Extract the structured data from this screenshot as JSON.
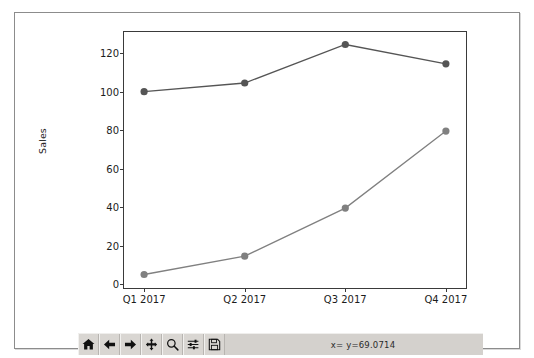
{
  "window": {
    "title": ""
  },
  "chart_data": {
    "type": "line",
    "title": "",
    "xlabel": "",
    "ylabel": "Sales",
    "categories": [
      "Q1 2017",
      "Q2 2017",
      "Q3 2017",
      "Q4 2017"
    ],
    "xtick_labels": [
      "Q1 2017",
      "Q2 2017",
      "Q3 2017",
      "Q4 2017"
    ],
    "ytick_labels": [
      "0",
      "20",
      "40",
      "60",
      "80",
      "100",
      "120"
    ],
    "yticks": [
      0,
      20,
      40,
      60,
      80,
      100,
      120
    ],
    "ylim": [
      -2,
      131
    ],
    "xlim": [
      -0.2,
      3.2
    ],
    "grid": false,
    "legend": null,
    "series": [
      {
        "name": "series-1",
        "color": "#555555",
        "marker": "o",
        "values": [
          100,
          104.5,
          124.5,
          114.5
        ]
      },
      {
        "name": "series-2",
        "color": "#808080",
        "marker": "o",
        "values": [
          5,
          14.5,
          39.5,
          79.5
        ]
      }
    ]
  },
  "toolbar": {
    "buttons": [
      {
        "name": "home-button",
        "icon": "home-icon",
        "tooltip": "Home"
      },
      {
        "name": "back-button",
        "icon": "arrow-left-icon",
        "tooltip": "Back"
      },
      {
        "name": "forward-button",
        "icon": "arrow-right-icon",
        "tooltip": "Forward"
      },
      {
        "name": "pan-button",
        "icon": "move-icon",
        "tooltip": "Pan"
      },
      {
        "name": "zoom-button",
        "icon": "magnifier-icon",
        "tooltip": "Zoom"
      },
      {
        "name": "configure-button",
        "icon": "sliders-icon",
        "tooltip": "Configure subplots"
      },
      {
        "name": "save-button",
        "icon": "floppy-disk-icon",
        "tooltip": "Save figure"
      }
    ],
    "coordinates": "x= y=69.0714"
  }
}
